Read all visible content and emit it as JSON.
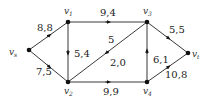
{
  "diagram": {
    "type": "directed flow network",
    "nodes": [
      {
        "id": "vs",
        "label": "v",
        "sub": "s",
        "x": 29,
        "y": 50,
        "lx": 9,
        "ly": 55
      },
      {
        "id": "v1",
        "label": "v",
        "sub": "1",
        "x": 68,
        "y": 22,
        "lx": 64,
        "ly": 14
      },
      {
        "id": "v2",
        "label": "v",
        "sub": "2",
        "x": 68,
        "y": 82,
        "lx": 64,
        "ly": 94
      },
      {
        "id": "v3",
        "label": "v",
        "sub": "3",
        "x": 147,
        "y": 22,
        "lx": 143,
        "ly": 14
      },
      {
        "id": "v4",
        "label": "v",
        "sub": "4",
        "x": 147,
        "y": 82,
        "lx": 143,
        "ly": 94
      },
      {
        "id": "vt",
        "label": "v",
        "sub": "t",
        "x": 188,
        "y": 53,
        "lx": 192,
        "ly": 57
      }
    ],
    "edges": [
      {
        "from": "vs",
        "to": "v1",
        "label": "8,8",
        "lx": 37,
        "ly": 31
      },
      {
        "from": "vs",
        "to": "v2",
        "label": "7,5",
        "lx": 36,
        "ly": 75
      },
      {
        "from": "v1",
        "to": "v2",
        "label": "5,4",
        "lx": 74,
        "ly": 57
      },
      {
        "from": "v1",
        "to": "v3",
        "label": "9,4",
        "lx": 100,
        "ly": 16
      },
      {
        "from": "v3",
        "to": "v2",
        "label": "5",
        "lx": 108,
        "ly": 43
      },
      {
        "from": "v3",
        "to": "v2",
        "label": "2,0",
        "lx": 110,
        "ly": 66
      },
      {
        "from": "v2",
        "to": "v4",
        "label": "9,9",
        "lx": 103,
        "ly": 95
      },
      {
        "from": "v4",
        "to": "v3",
        "label": "6,1",
        "lx": 153,
        "ly": 63
      },
      {
        "from": "v3",
        "to": "vt",
        "label": "5,5",
        "lx": 169,
        "ly": 33
      },
      {
        "from": "v4",
        "to": "vt",
        "label": "10,8",
        "lx": 165,
        "ly": 78
      }
    ]
  }
}
